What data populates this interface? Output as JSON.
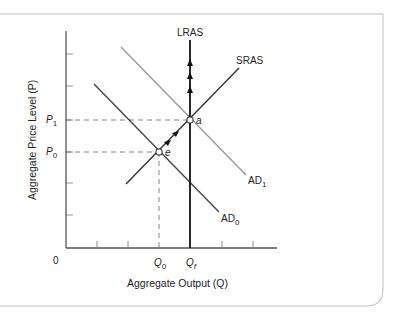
{
  "diagram": {
    "type": "AD-AS model",
    "axes": {
      "y_title": "Aggregate Price Level (P)",
      "x_title": "Aggregate Output (Q)",
      "origin_label": "0"
    },
    "price_levels": [
      {
        "symbol": "P",
        "sub": "1"
      },
      {
        "symbol": "P",
        "sub": "0"
      }
    ],
    "output_levels": [
      {
        "symbol": "Q",
        "sub": "0"
      },
      {
        "symbol": "Q",
        "sub": "f"
      }
    ],
    "curves": {
      "lras": {
        "label": "LRAS",
        "color": "#111111"
      },
      "sras": {
        "label": "SRAS",
        "color": "#333333"
      },
      "ad1": {
        "label": "AD",
        "sub": "1",
        "color": "#9a9a9a"
      },
      "ad0": {
        "label": "AD",
        "sub": "0",
        "color": "#444444"
      }
    },
    "points": [
      {
        "label": "e",
        "desc": "initial equilibrium at P0, Q0"
      },
      {
        "label": "a",
        "desc": "new equilibrium at P1, Qf"
      }
    ],
    "frame_color": "#bdbdbd"
  }
}
